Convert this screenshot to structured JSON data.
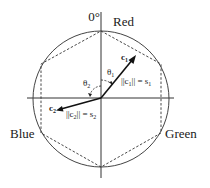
{
  "diagram": {
    "angle_label": "0°",
    "colors": {
      "top": "Red",
      "left": "Blue",
      "right": "Green"
    },
    "vectors": [
      {
        "name": "c",
        "sub": "1",
        "theta": "θ",
        "theta_sub": "1",
        "norm_label": "||c",
        "norm_sub": "1",
        "norm_eq": "|| = s",
        "s_sub": "1"
      },
      {
        "name": "c",
        "sub": "2",
        "theta": "θ",
        "theta_sub": "2",
        "norm_label": "||c",
        "norm_sub": "2",
        "norm_eq": "|| = s",
        "s_sub": "2"
      }
    ],
    "stroke_color": "#333333"
  }
}
